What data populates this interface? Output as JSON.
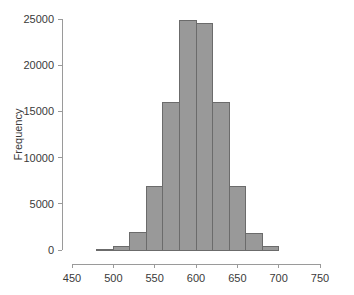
{
  "chart_data": {
    "type": "bar",
    "title": "",
    "subtitle": "",
    "xlabel": "",
    "ylabel": "Frequency",
    "xlim": [
      450,
      750
    ],
    "ylim": [
      0,
      25000
    ],
    "grid": false,
    "legend": null,
    "bin_width": 20,
    "bin_edges": [
      480,
      500,
      520,
      540,
      560,
      580,
      600,
      620,
      640,
      660,
      680,
      700
    ],
    "categories": [
      "480-500",
      "500-520",
      "520-540",
      "540-560",
      "560-580",
      "580-600",
      "600-620",
      "620-640",
      "640-660",
      "660-680",
      "680-700"
    ],
    "bin_centers": [
      490,
      510,
      530,
      550,
      570,
      590,
      610,
      630,
      650,
      670,
      690
    ],
    "values": [
      60,
      350,
      1850,
      6850,
      15950,
      24800,
      24500,
      16000,
      6900,
      1800,
      330
    ],
    "xticks": [
      450,
      500,
      550,
      600,
      650,
      700,
      750
    ],
    "xtick_labels": [
      "450",
      "500",
      "550",
      "600",
      "650",
      "700",
      "750"
    ],
    "yticks": [
      0,
      5000,
      10000,
      15000,
      20000,
      25000
    ],
    "ytick_labels": [
      "0",
      "5000",
      "10000",
      "15000",
      "20000",
      "25000"
    ],
    "bar_fill_color": "#999999",
    "bar_edge_color": "#6b6b6b",
    "axis_color": "#9a9a9a",
    "text_color": "#3a3a3a",
    "background_color": "#ffffff"
  }
}
